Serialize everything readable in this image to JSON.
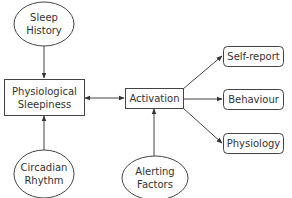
{
  "diagram": {
    "nodes": {
      "sleep_history": {
        "line1": "Sleep",
        "line2": "History",
        "shape": "ellipse"
      },
      "physiological_sleepiness": {
        "line1": "Physiological",
        "line2": "Sleepiness",
        "shape": "rectangle"
      },
      "circadian_rhythm": {
        "line1": "Circadian",
        "line2": "Rhythm",
        "shape": "ellipse"
      },
      "activation": {
        "label": "Activation",
        "shape": "rectangle"
      },
      "alerting_factors": {
        "line1": "Alerting",
        "line2": "Factors",
        "shape": "ellipse"
      },
      "self_report": {
        "label": "Self-report",
        "shape": "rounded-rectangle"
      },
      "behaviour": {
        "label": "Behaviour",
        "shape": "rounded-rectangle"
      },
      "physiology": {
        "label": "Physiology",
        "shape": "rounded-rectangle"
      }
    },
    "edges": [
      {
        "from": "Sleep History",
        "to": "Physiological Sleepiness",
        "type": "arrow"
      },
      {
        "from": "Circadian Rhythm",
        "to": "Physiological Sleepiness",
        "type": "arrow"
      },
      {
        "from": "Physiological Sleepiness",
        "to": "Activation",
        "type": "bidirectional"
      },
      {
        "from": "Alerting Factors",
        "to": "Activation",
        "type": "arrow"
      },
      {
        "from": "Activation",
        "to": "Self-report",
        "type": "arrow"
      },
      {
        "from": "Activation",
        "to": "Behaviour",
        "type": "arrow"
      },
      {
        "from": "Activation",
        "to": "Physiology",
        "type": "arrow"
      }
    ],
    "colors": {
      "stroke": "#444444",
      "text": "#333333",
      "background": "#ffffff"
    }
  }
}
